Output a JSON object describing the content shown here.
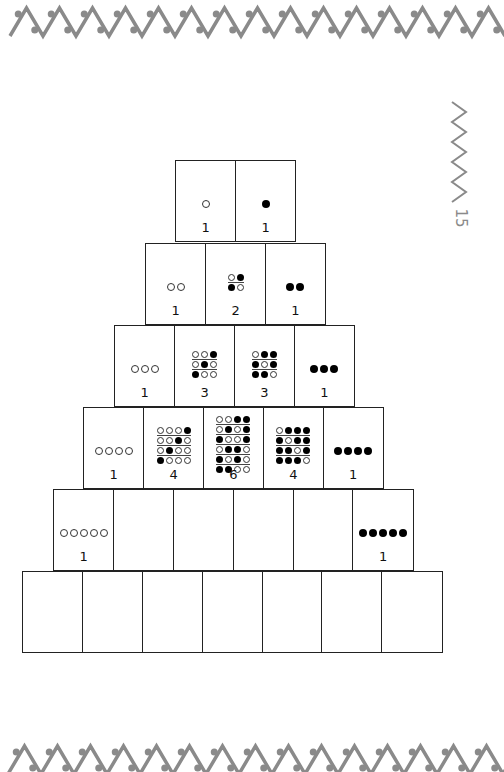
{
  "page": {
    "page_number": "15",
    "decoration": {
      "top_border": "zigzag-dots-border",
      "bottom_border": "zigzag-dots-border",
      "side_ornament": "zigzag-vertical",
      "color": "#8a8a8a"
    }
  },
  "pyramid": {
    "rows": [
      {
        "row": 1,
        "left": 175,
        "top": 160,
        "cells": [
          {
            "count": "1",
            "patterns": [
              [
                "w"
              ]
            ]
          },
          {
            "count": "1",
            "patterns": [
              [
                "b"
              ]
            ]
          }
        ]
      },
      {
        "row": 2,
        "left": 145,
        "top": 243,
        "cells": [
          {
            "count": "1",
            "patterns": [
              [
                "w",
                "w"
              ]
            ]
          },
          {
            "count": "2",
            "patterns": [
              [
                "w",
                "b"
              ],
              [
                "b",
                "w"
              ]
            ]
          },
          {
            "count": "1",
            "patterns": [
              [
                "b",
                "b"
              ]
            ]
          }
        ]
      },
      {
        "row": 3,
        "left": 114,
        "top": 325,
        "cells": [
          {
            "count": "1",
            "patterns": [
              [
                "w",
                "w",
                "w"
              ]
            ]
          },
          {
            "count": "3",
            "patterns": [
              [
                "w",
                "w",
                "b"
              ],
              [
                "w",
                "b",
                "w"
              ],
              [
                "b",
                "w",
                "w"
              ]
            ]
          },
          {
            "count": "3",
            "patterns": [
              [
                "w",
                "b",
                "b"
              ],
              [
                "b",
                "w",
                "b"
              ],
              [
                "b",
                "b",
                "w"
              ]
            ]
          },
          {
            "count": "1",
            "patterns": [
              [
                "b",
                "b",
                "b"
              ]
            ]
          }
        ]
      },
      {
        "row": 4,
        "left": 83,
        "top": 407,
        "cells": [
          {
            "count": "1",
            "patterns": [
              [
                "w",
                "w",
                "w",
                "w"
              ]
            ]
          },
          {
            "count": "4",
            "patterns": [
              [
                "w",
                "w",
                "w",
                "b"
              ],
              [
                "w",
                "w",
                "b",
                "w"
              ],
              [
                "w",
                "b",
                "w",
                "w"
              ],
              [
                "b",
                "w",
                "w",
                "w"
              ]
            ]
          },
          {
            "count": "6",
            "patterns": [
              [
                "w",
                "w",
                "b",
                "b"
              ],
              [
                "w",
                "b",
                "w",
                "b"
              ],
              [
                "b",
                "w",
                "w",
                "b"
              ],
              [
                "w",
                "b",
                "b",
                "w"
              ],
              [
                "b",
                "w",
                "b",
                "w"
              ],
              [
                "b",
                "b",
                "w",
                "w"
              ]
            ]
          },
          {
            "count": "4",
            "patterns": [
              [
                "w",
                "b",
                "b",
                "b"
              ],
              [
                "b",
                "w",
                "b",
                "b"
              ],
              [
                "b",
                "b",
                "w",
                "b"
              ],
              [
                "b",
                "b",
                "b",
                "w"
              ]
            ]
          },
          {
            "count": "1",
            "patterns": [
              [
                "b",
                "b",
                "b",
                "b"
              ]
            ]
          }
        ]
      },
      {
        "row": 5,
        "left": 53,
        "top": 489,
        "cells": [
          {
            "count": "1",
            "patterns": [
              [
                "w",
                "w",
                "w",
                "w",
                "w"
              ]
            ]
          },
          {
            "count": "",
            "patterns": []
          },
          {
            "count": "",
            "patterns": []
          },
          {
            "count": "",
            "patterns": []
          },
          {
            "count": "",
            "patterns": []
          },
          {
            "count": "1",
            "patterns": [
              [
                "b",
                "b",
                "b",
                "b",
                "b"
              ]
            ]
          }
        ]
      },
      {
        "row": 6,
        "left": 22,
        "top": 571,
        "cells": [
          {
            "count": "",
            "patterns": []
          },
          {
            "count": "",
            "patterns": []
          },
          {
            "count": "",
            "patterns": []
          },
          {
            "count": "",
            "patterns": []
          },
          {
            "count": "",
            "patterns": []
          },
          {
            "count": "",
            "patterns": []
          },
          {
            "count": "",
            "patterns": []
          }
        ]
      }
    ]
  }
}
